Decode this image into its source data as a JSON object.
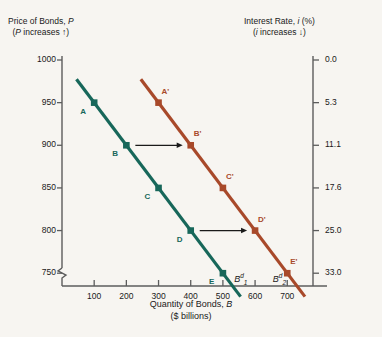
{
  "figure": {
    "background_color": "#f7f5f1",
    "left_header": {
      "main": "Price of Bonds, P",
      "sub": "(P increases ↑)"
    },
    "right_header": {
      "main": "Interest Rate, i (%)",
      "sub": "(i increases ↓)"
    },
    "xaxis_title_line1": "Quantity of Bonds, B",
    "xaxis_title_line2": "($ billions)"
  },
  "chart_data": {
    "type": "line",
    "title": "",
    "xlabel": "Quantity of Bonds, B ($ billions)",
    "ylabel": "Price of Bonds, P",
    "y2label": "Interest Rate, i (%)",
    "xlim": [
      0,
      780
    ],
    "ylim": [
      735,
      1000
    ],
    "grid": false,
    "legend_position": "inline-curve-labels",
    "x_ticks": [
      100,
      200,
      300,
      400,
      500,
      600,
      700
    ],
    "y_ticks": [
      1000,
      950,
      900,
      850,
      800,
      750
    ],
    "y_axis_break": true,
    "y2_ticks": [
      {
        "price": 1000,
        "label": "0.0"
      },
      {
        "price": 950,
        "label": "5.3"
      },
      {
        "price": 900,
        "label": "11.1"
      },
      {
        "price": 850,
        "label": "17.6"
      },
      {
        "price": 800,
        "label": "25.0"
      },
      {
        "price": 750,
        "label": "33.0"
      }
    ],
    "series": [
      {
        "name": "B1d",
        "display_label": "B",
        "label_sub": "1",
        "label_sup": "d",
        "color": "#17675a",
        "x": [
          100,
          200,
          300,
          400,
          500
        ],
        "values": [
          950,
          900,
          850,
          800,
          750
        ],
        "point_labels": [
          "A",
          "B",
          "C",
          "D",
          "E"
        ],
        "label_x": 560,
        "label_y": 742
      },
      {
        "name": "B2d",
        "display_label": "B",
        "label_sub": "2",
        "label_sup": "d",
        "color": "#a8492a",
        "x": [
          300,
          400,
          500,
          600,
          700
        ],
        "values": [
          950,
          900,
          850,
          800,
          750
        ],
        "point_labels": [
          "A'",
          "B'",
          "C'",
          "D'",
          "E'"
        ],
        "label_x": 680,
        "label_y": 742
      }
    ],
    "annotations": [
      {
        "type": "arrow",
        "from_x": 200,
        "from_y": 900,
        "to_x": 400,
        "to_y": 900,
        "color": "#1a1a1a"
      },
      {
        "type": "arrow",
        "from_x": 400,
        "from_y": 800,
        "to_x": 600,
        "to_y": 800,
        "color": "#1a1a1a"
      }
    ]
  }
}
